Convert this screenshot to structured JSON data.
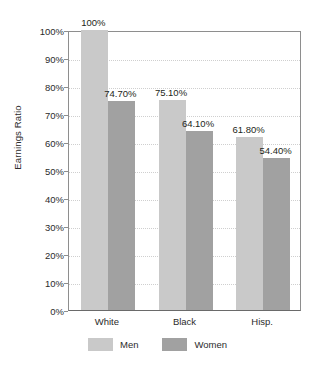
{
  "chart_data": {
    "type": "bar",
    "title": "",
    "subtitle": "",
    "xlabel": "",
    "ylabel": "Earnings Ratio",
    "categories": [
      "White",
      "Black",
      "Hisp."
    ],
    "series": [
      {
        "name": "Men",
        "color": "#c9c9c9",
        "values": [
          100,
          75.1,
          61.8
        ],
        "labels": [
          "100%",
          "75.10%",
          "61.80%"
        ]
      },
      {
        "name": "Women",
        "color": "#a1a1a1",
        "values": [
          74.7,
          64.1,
          54.4
        ],
        "labels": [
          "74.70%",
          "64.10%",
          "54.40%"
        ]
      }
    ],
    "ylim": [
      0,
      100
    ],
    "ytick_values": [
      100,
      90,
      80,
      70,
      60,
      50,
      40,
      30,
      20,
      10,
      0
    ],
    "ytick_labels": [
      "100%",
      "90%",
      "80%",
      "70%",
      "60%",
      "50%",
      "40%",
      "30%",
      "20%",
      "10%",
      "0%"
    ],
    "grid": true,
    "grid_axis": "y",
    "legend_position": "bottom",
    "legend_entries": [
      "Men",
      "Women"
    ],
    "background_color": "#ffffff",
    "axis_color": "#8e8e8e"
  }
}
